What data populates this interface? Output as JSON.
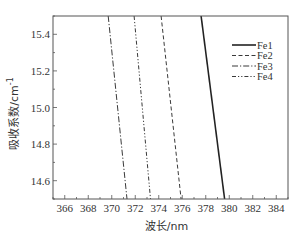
{
  "chart_data": {
    "type": "line",
    "title": "",
    "xlabel": "波长/nm",
    "ylabel": "吸收系数/cm",
    "ylabel_superscript": "-1",
    "xlim": [
      365,
      385
    ],
    "ylim": [
      14.5,
      15.5
    ],
    "xticks": [
      366,
      368,
      370,
      372,
      374,
      376,
      378,
      380,
      382,
      384
    ],
    "xtick_labels": [
      "366",
      "368",
      "370",
      "372",
      "374",
      "376",
      "378",
      "380",
      "382",
      "384"
    ],
    "yticks": [
      14.6,
      14.8,
      15.0,
      15.2,
      15.4
    ],
    "ytick_labels": [
      "14.6",
      "14.8",
      "15.0",
      "15.2",
      "15.4"
    ],
    "grid": false,
    "legend_position": "upper right",
    "series": [
      {
        "name": "Fe1",
        "style": "solid",
        "width": 1.6,
        "x": [
          377.6,
          379.6
        ],
        "y": [
          15.5,
          14.5
        ]
      },
      {
        "name": "Fe2",
        "style": "dashed",
        "width": 0.9,
        "x": [
          374.2,
          375.9
        ],
        "y": [
          15.5,
          14.5
        ]
      },
      {
        "name": "Fe3",
        "style": "dashdot",
        "width": 0.9,
        "x": [
          369.7,
          371.3
        ],
        "y": [
          15.5,
          14.5
        ]
      },
      {
        "name": "Fe4",
        "style": "dashdotdot",
        "width": 0.9,
        "x": [
          371.9,
          373.3
        ],
        "y": [
          15.5,
          14.5
        ]
      }
    ]
  },
  "colors": {
    "line": "#222222",
    "axis": "#555555",
    "text": "#333333"
  }
}
